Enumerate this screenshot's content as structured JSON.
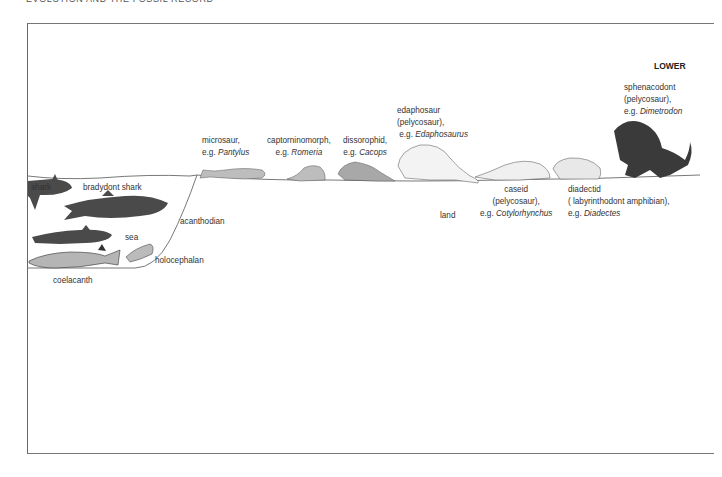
{
  "page": {
    "running_head": "EVOLUTION AND THE FOSSIL RECORD"
  },
  "figure": {
    "period_label": "LOWER",
    "environments": {
      "sea": "sea",
      "land": "land"
    },
    "sea_animals": [
      {
        "name": "shark"
      },
      {
        "name": "bradydont shark"
      },
      {
        "name": "acanthodian"
      },
      {
        "name": "holocephalan"
      },
      {
        "name": "coelacanth"
      }
    ],
    "land_animals": [
      {
        "group": "microsaur,",
        "example_prefix": "e.g. ",
        "example": "Pantylus"
      },
      {
        "group": "captorninomorph,",
        "example_prefix": "e.g. ",
        "example": "Romeria"
      },
      {
        "group": "dissorophid,",
        "example_prefix": "e.g. ",
        "example": "Cacops"
      },
      {
        "group": "edaphosaur",
        "subgroup": "(pelycosaur),",
        "example_prefix": "e.g. ",
        "example": "Edaphosaurus"
      },
      {
        "group": "caseid",
        "subgroup": "(pelycosaur),",
        "example_prefix": "e.g. ",
        "example": "Cotylorhynchus"
      },
      {
        "group": "diadectid",
        "subgroup": "( labyrinthodont amphibian),",
        "example_prefix": "e.g. ",
        "example": "Diadectes"
      },
      {
        "group": "sphenacodont",
        "subgroup": "(pelycosaur),",
        "example_prefix": "e.g. ",
        "example": "Dimetrodon"
      }
    ],
    "colors": {
      "dark_fill": "#4a4a4a",
      "mid_fill": "#9a9a9a",
      "light_fill": "#c8c8c8",
      "line": "#555555"
    }
  }
}
